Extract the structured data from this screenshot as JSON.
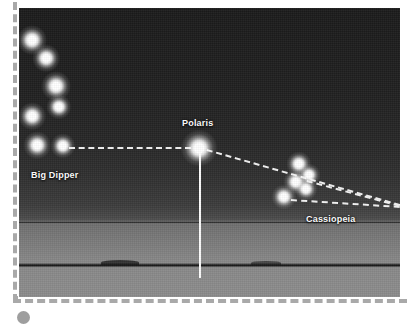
{
  "figure": {
    "kind": "night-sky-star-chart-photograph",
    "background_color": "#ffffff",
    "frame": {
      "style": "dashed",
      "color": "#a9a9a9"
    },
    "photo": {
      "left": 19,
      "top": 8,
      "width": 381,
      "height": 289,
      "sky_top_color": "#1b1b1b",
      "ground_color": "#8c8c8c",
      "horizon_line_y": 214,
      "treeline_y": 255
    }
  },
  "labels": {
    "big_dipper": "Big Dipper",
    "polaris": "Polaris",
    "cassiopeia": "Cassiopeia"
  },
  "chart_data": {
    "type": "scatter",
    "title": "",
    "xlabel": "",
    "ylabel": "",
    "grid": false,
    "legend": "none",
    "note": "Star positions are in photo-local pixel coordinates (origin = photo top-left, 381x289).",
    "constellations": [
      {
        "name": "Big Dipper",
        "label_x": 12,
        "label_y": 162,
        "star_count": 7,
        "stars": [
          {
            "id": "dubhe",
            "x": 13,
            "y": 32,
            "size": 13
          },
          {
            "id": "merak",
            "x": 27,
            "y": 50,
            "size": 12
          },
          {
            "id": "phecda",
            "x": 37,
            "y": 78,
            "size": 13
          },
          {
            "id": "megrez",
            "x": 40,
            "y": 99,
            "size": 11
          },
          {
            "id": "alioth",
            "x": 13,
            "y": 108,
            "size": 12
          },
          {
            "id": "mizar",
            "x": 18,
            "y": 137,
            "size": 12
          },
          {
            "id": "alkaid",
            "x": 44,
            "y": 138,
            "size": 11
          }
        ]
      },
      {
        "name": "Cassiopeia",
        "label_x": 287,
        "label_y": 206,
        "star_count": 5,
        "stars": [
          {
            "id": "segin",
            "x": 280,
            "y": 156,
            "size": 11
          },
          {
            "id": "ruchbah",
            "x": 290,
            "y": 167,
            "size": 10
          },
          {
            "id": "gamma-cas",
            "x": 277,
            "y": 174,
            "size": 11
          },
          {
            "id": "schedar",
            "x": 287,
            "y": 181,
            "size": 10
          },
          {
            "id": "caph",
            "x": 265,
            "y": 189,
            "size": 11
          }
        ]
      },
      {
        "name": "Polaris",
        "label_x": 163,
        "label_y": 110,
        "star_count": 1,
        "stars": [
          {
            "id": "polaris",
            "x": 180,
            "y": 140,
            "size": 16
          }
        ]
      }
    ],
    "pointer_lines": [
      {
        "id": "dipper-to-polaris",
        "x1": 50,
        "y1": 139,
        "x2": 172,
        "y2": 139
      },
      {
        "id": "polaris-to-right-1",
        "x1": 188,
        "y1": 141,
        "x2": 381,
        "y2": 196
      },
      {
        "id": "cassiopeia-ray-2",
        "x1": 288,
        "y1": 172,
        "x2": 381,
        "y2": 197
      },
      {
        "id": "cassiopeia-ray-3",
        "x1": 272,
        "y1": 191,
        "x2": 381,
        "y2": 198
      }
    ],
    "meridian_line": {
      "id": "polaris-meridian",
      "x": 180,
      "y_top": 140,
      "y_bottom": 270,
      "color": "#fcfcfc"
    }
  }
}
